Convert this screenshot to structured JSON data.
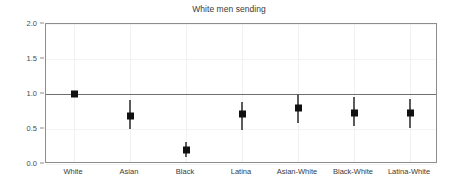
{
  "chart_data": {
    "type": "scatter",
    "title": "White men sending",
    "xlabel": "",
    "ylabel": "",
    "ylim": [
      0.0,
      2.0
    ],
    "yticks": [
      "0.0",
      "0.5",
      "1.0",
      "1.5",
      "2.0"
    ],
    "ytick_values": [
      0.0,
      0.5,
      1.0,
      1.5,
      2.0
    ],
    "grid": "faint",
    "legend": "none",
    "reference_line": 1.0,
    "categories": [
      "White",
      "Asian",
      "Black",
      "Latina",
      "Asian-White",
      "Black-White",
      "Latina-White"
    ],
    "values": [
      1.0,
      0.68,
      0.2,
      0.72,
      0.8,
      0.73,
      0.73
    ],
    "ci_low": [
      1.0,
      0.5,
      0.1,
      0.49,
      0.59,
      0.54,
      0.52
    ],
    "ci_high": [
      1.0,
      0.92,
      0.31,
      0.88,
      1.0,
      0.96,
      0.93
    ],
    "points": [
      {
        "category": "White",
        "value": 1.0,
        "ci_low": 1.0,
        "ci_high": 1.0,
        "reference": true
      },
      {
        "category": "Asian",
        "value": 0.68,
        "ci_low": 0.5,
        "ci_high": 0.92,
        "reference": false
      },
      {
        "category": "Black",
        "value": 0.2,
        "ci_low": 0.1,
        "ci_high": 0.31,
        "reference": false
      },
      {
        "category": "Latina",
        "value": 0.72,
        "ci_low": 0.49,
        "ci_high": 0.88,
        "reference": false
      },
      {
        "category": "Asian-White",
        "value": 0.8,
        "ci_low": 0.59,
        "ci_high": 1.0,
        "reference": false
      },
      {
        "category": "Black-White",
        "value": 0.73,
        "ci_low": 0.54,
        "ci_high": 0.96,
        "reference": false
      },
      {
        "category": "Latina-White",
        "value": 0.73,
        "ci_low": 0.52,
        "ci_high": 0.93,
        "reference": false
      }
    ]
  },
  "colors": {
    "background": "#ffffff",
    "frame": "#8d8d8d",
    "reference_line": "#6f6f6f",
    "marker": "#111111",
    "whisker": "#5b5b5b",
    "grid": "#f1f1f1",
    "text": "#3a3a3a"
  }
}
